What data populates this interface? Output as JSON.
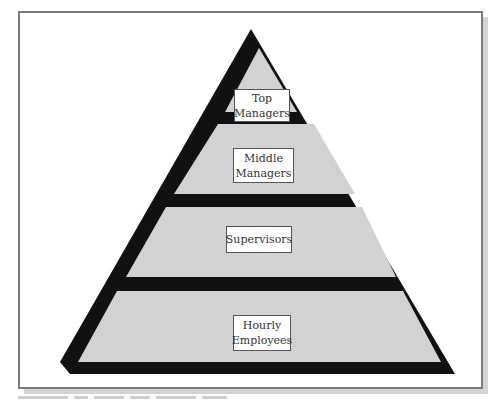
{
  "diagram": {
    "type": "pyramid",
    "levels": [
      {
        "label": "Top\nManagers",
        "rank": 1
      },
      {
        "label": "Middle\nManagers",
        "rank": 2
      },
      {
        "label": "Supervisors",
        "rank": 3
      },
      {
        "label": "Hourly\nEmployees",
        "rank": 4
      }
    ],
    "colors": {
      "outline": "#111111",
      "band_fill": "#d2d2d2",
      "label_bg": "#ffffff",
      "frame_border": "#7a7a7a",
      "shadow": "#d4d4d4"
    }
  }
}
